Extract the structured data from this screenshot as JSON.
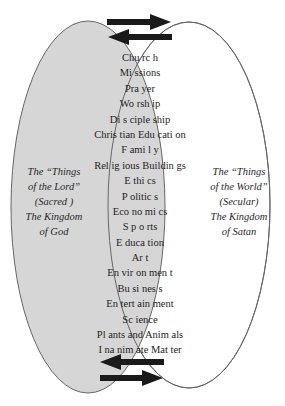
{
  "diagram": {
    "type": "venn",
    "colors": {
      "left_fill": "#d6d6d6",
      "right_fill": "#ffffff",
      "outline": "#555555",
      "arrow": "#1a1a1a",
      "text": "#1e1e1e"
    },
    "left_circle": {
      "lines": [
        "The “Things",
        "of the Lord”",
        "(Sacred )",
        "The Kingdom",
        "of God"
      ]
    },
    "right_circle": {
      "lines": [
        "The “Things",
        "of the World”",
        "(Secular)",
        "The Kingdom",
        "of Satan"
      ]
    },
    "overlap_items": [
      "Chu rc h",
      "Mi ssions",
      "Pra yer",
      "Wo rsh ip",
      "Di s ciple ship",
      "Chris tian Edu cati on",
      "F ami l y",
      "Rel ig ious Buildin gs",
      "E thi cs",
      "P olitic s",
      "Eco no mi cs",
      "S p o rts",
      "E duca tion",
      "Ar t",
      "En vir on men t",
      "Bu si nes s",
      "En tert ain ment",
      "Sc ience",
      "Pl ants and Anim als",
      "I na nim ate Mat ter"
    ],
    "arrows": {
      "top": [
        "right",
        "left"
      ],
      "bottom": [
        "left",
        "right"
      ]
    }
  }
}
